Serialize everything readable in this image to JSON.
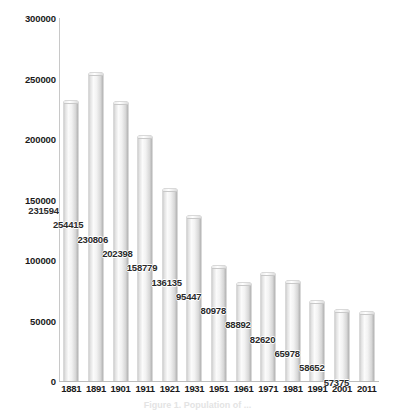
{
  "chart_data": {
    "type": "bar",
    "title": "",
    "subtitle": "",
    "xlabel": "",
    "ylabel": "",
    "categories": [
      "1881",
      "1891",
      "1901",
      "1911",
      "1921",
      "1931",
      "1951",
      "1961",
      "1971",
      "1981",
      "1991",
      "2001",
      "2011"
    ],
    "values": [
      231594,
      254415,
      230806,
      202398,
      158779,
      136135,
      95447,
      80978,
      88892,
      82620,
      65978,
      58652,
      57375
    ],
    "data_labels": [
      "231594",
      "254415",
      "230806",
      "202398",
      "158779",
      "136135",
      "95447",
      "80978",
      "88892",
      "82620",
      "65978",
      "58652",
      "57375"
    ],
    "ylim": [
      0,
      300000
    ],
    "yticks": [
      0,
      50000,
      100000,
      150000,
      200000,
      250000,
      300000
    ],
    "ytick_labels": [
      "0",
      "50000",
      "100000",
      "150000",
      "200000",
      "250000",
      "300000"
    ],
    "xtick_labels": [
      "1881",
      "1891",
      "1901",
      "1911",
      "1921",
      "1931",
      "1951",
      "1961",
      "1971",
      "1981",
      "1991",
      "2001",
      "2011"
    ],
    "grid": false,
    "legend": null,
    "legend_position": "none",
    "bar_color": "#e8e8e8",
    "bar_edge_color": "#b4b4b4",
    "axis_color": "#c8c8c8",
    "text_color": "#1a1a1a",
    "background": "#ffffff"
  },
  "caption": {
    "text": "Figure 1. Population of ...",
    "visible": "partially-clipped"
  }
}
